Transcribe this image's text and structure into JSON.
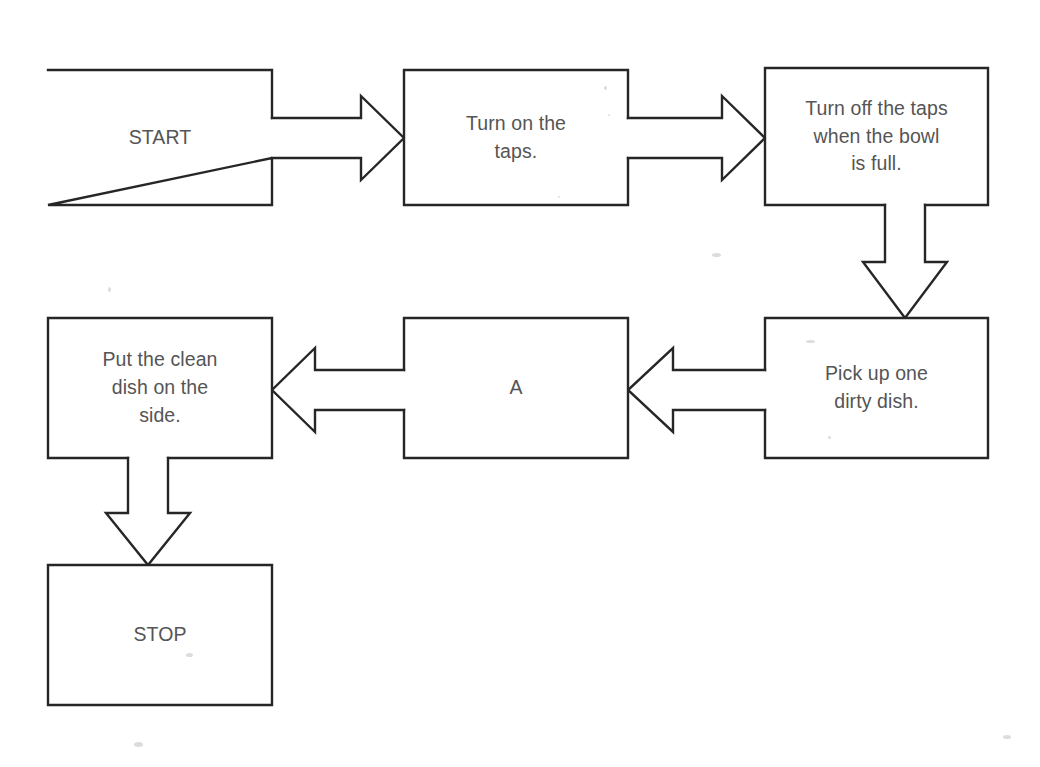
{
  "diagram": {
    "type": "flowchart",
    "background_color": "#ffffff",
    "stroke_color": "#262626",
    "text_color": "#555555",
    "nodes": [
      {
        "id": "start",
        "label": "START",
        "kind": "terminator",
        "x": 48,
        "y": 70,
        "w": 224,
        "h": 135
      },
      {
        "id": "turn-on-taps",
        "label": "Turn on the\ntaps.",
        "kind": "process",
        "x": 404,
        "y": 70,
        "w": 224,
        "h": 135
      },
      {
        "id": "turn-off-taps",
        "label": "Turn off the taps\nwhen the bowl\nis full.",
        "kind": "process",
        "x": 765,
        "y": 68,
        "w": 223,
        "h": 137
      },
      {
        "id": "pick-up-dish",
        "label": "Pick up one\ndirty dish.",
        "kind": "process",
        "x": 765,
        "y": 318,
        "w": 223,
        "h": 140
      },
      {
        "id": "step-a",
        "label": "A",
        "kind": "process",
        "x": 404,
        "y": 318,
        "w": 224,
        "h": 140
      },
      {
        "id": "put-clean-dish",
        "label": "Put the clean\ndish on the\nside.",
        "kind": "process",
        "x": 48,
        "y": 318,
        "w": 224,
        "h": 140
      },
      {
        "id": "stop",
        "label": "STOP",
        "kind": "terminator",
        "x": 48,
        "y": 565,
        "w": 224,
        "h": 140
      }
    ],
    "connectors": [
      {
        "id": "start-to-turn-on-taps",
        "from": "start",
        "to": "turn-on-taps",
        "direction": "right"
      },
      {
        "id": "turn-on-taps-to-turn-off-taps",
        "from": "turn-on-taps",
        "to": "turn-off-taps",
        "direction": "right"
      },
      {
        "id": "turn-off-taps-to-pick-up-dish",
        "from": "turn-off-taps",
        "to": "pick-up-dish",
        "direction": "down"
      },
      {
        "id": "pick-up-dish-to-step-a",
        "from": "pick-up-dish",
        "to": "step-a",
        "direction": "left"
      },
      {
        "id": "step-a-to-put-clean-dish",
        "from": "step-a",
        "to": "put-clean-dish",
        "direction": "left"
      },
      {
        "id": "put-clean-dish-to-stop",
        "from": "put-clean-dish",
        "to": "stop",
        "direction": "down"
      }
    ]
  }
}
